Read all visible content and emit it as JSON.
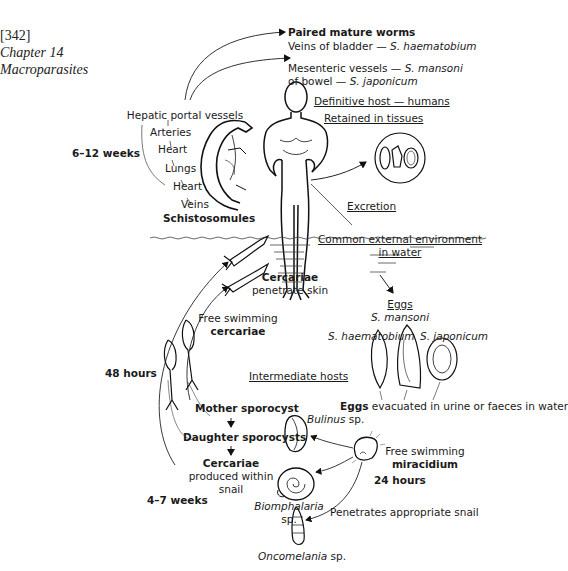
{
  "header": {
    "page_number": "[342]",
    "chapter": "Chapter 14",
    "section": "Macroparasites"
  },
  "definitive_host": {
    "paired_worms_title": "Paired mature worms",
    "bladder_site": "Veins of bladder — ",
    "bladder_species": "S. haematobium",
    "mesenteric_site": "Mesenteric vessels — ",
    "mesenteric_species": "S. mansoni",
    "bowel_site": "of bowel — ",
    "bowel_species": "S. japonicum",
    "host_label": "Definitive host — humans",
    "retained_label": "Retained in tissues",
    "excretion_label": "Excretion"
  },
  "migration": {
    "path": [
      "Hepatic portal vessels",
      "Arteries",
      "Heart",
      "Lungs",
      "Heart",
      "Veins"
    ],
    "stage": "Schistosomules",
    "duration": "6–12 weeks"
  },
  "environment": {
    "line1": "Common external environment",
    "line2": "in water",
    "cercariae_title": "Cercariae",
    "cercariae_sub": "penetrate skin",
    "free_swimming": "Free swimming",
    "free_swimming_stage": "cercariae",
    "cercariae_duration": "48 hours"
  },
  "eggs": {
    "title": "Eggs",
    "mansoni": "S. mansoni",
    "haematobium": "S. haematobium",
    "japonicum": "S. japonicum",
    "evacuated_bold": "Eggs",
    "evacuated_rest": " evacuated in urine or faeces in water"
  },
  "intermediate": {
    "title": "Intermediate hosts",
    "mother": "Mother sporocyst",
    "daughter": "Daughter sporocysts",
    "cercariae_title": "Cercariae",
    "produced_line1": "produced within",
    "produced_line2": "snail",
    "duration": "4–7 weeks",
    "bulinus": "Bulinus",
    "bulinus_sp": " sp.",
    "biomphalaria": "Biomphalaria",
    "biomphalaria_sp": "sp.",
    "oncomelania": "Oncomelania",
    "oncomelania_sp": " sp."
  },
  "miracidium": {
    "line1": "Free swimming",
    "line2": "miracidium",
    "duration": "24 hours",
    "penetrates": "Penetrates appropriate snail"
  }
}
